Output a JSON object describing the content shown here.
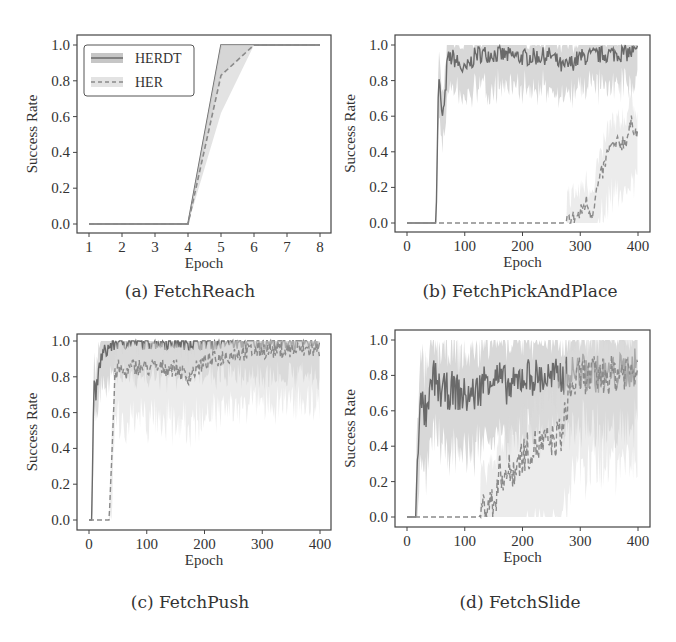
{
  "figure": {
    "legend": [
      {
        "label": "HERDT",
        "style": "solid"
      },
      {
        "label": "HER",
        "style": "dashed"
      }
    ],
    "colors": {
      "herdt_line": "#6a6a6a",
      "herdt_band": "#b8b8b8",
      "her_line": "#8a8a8a",
      "her_band": "#dcdcdc",
      "axis": "#444444"
    }
  },
  "chart_data": [
    {
      "id": "a",
      "type": "line",
      "caption": "(a) FetchReach",
      "xlabel": "Epoch",
      "ylabel": "Success Rate",
      "xticks": [
        "1",
        "2",
        "3",
        "4",
        "5",
        "6",
        "7",
        "8"
      ],
      "yticks": [
        "0.0",
        "0.2",
        "0.4",
        "0.6",
        "0.8",
        "1.0"
      ],
      "xlim": [
        1,
        8
      ],
      "ylim": [
        0,
        1
      ],
      "legend_position": "upper left",
      "series": [
        {
          "name": "HERDT",
          "x": [
            1,
            2,
            3,
            4,
            5,
            6,
            7,
            8
          ],
          "values": [
            0,
            0,
            0,
            0,
            1.0,
            1.0,
            1.0,
            1.0
          ]
        },
        {
          "name": "HER",
          "x": [
            1,
            2,
            3,
            4,
            5,
            6,
            7,
            8
          ],
          "values": [
            0,
            0,
            0,
            0,
            0.83,
            1.0,
            1.0,
            1.0
          ]
        }
      ]
    },
    {
      "id": "b",
      "type": "line",
      "caption": "(b) FetchPickAndPlace",
      "xlabel": "Epoch",
      "ylabel": "Success Rate",
      "xticks": [
        "0",
        "100",
        "200",
        "300",
        "400"
      ],
      "yticks": [
        "0.0",
        "0.2",
        "0.4",
        "0.6",
        "0.8",
        "1.0"
      ],
      "xlim": [
        0,
        400
      ],
      "ylim": [
        0,
        1
      ],
      "series": [
        {
          "name": "HERDT",
          "x": [
            0,
            50,
            55,
            60,
            65,
            70,
            80,
            100,
            120,
            150,
            200,
            250,
            270,
            300,
            350,
            400
          ],
          "values": [
            0,
            0,
            0.85,
            0.6,
            0.65,
            0.92,
            0.93,
            0.85,
            0.95,
            0.95,
            0.93,
            0.94,
            0.87,
            0.93,
            0.95,
            0.96
          ]
        },
        {
          "name": "HER",
          "x": [
            0,
            100,
            200,
            270,
            290,
            300,
            310,
            320,
            330,
            340,
            350,
            360,
            380,
            390,
            400
          ],
          "values": [
            0,
            0,
            0,
            0,
            0.03,
            0.05,
            0.12,
            0.05,
            0.2,
            0.3,
            0.42,
            0.43,
            0.47,
            0.57,
            0.48
          ]
        }
      ]
    },
    {
      "id": "c",
      "type": "line",
      "caption": "(c) FetchPush",
      "xlabel": "Epoch",
      "ylabel": "Success Rate",
      "xticks": [
        "0",
        "100",
        "200",
        "300",
        "400"
      ],
      "yticks": [
        "0.0",
        "0.2",
        "0.4",
        "0.6",
        "0.8",
        "1.0"
      ],
      "xlim": [
        0,
        400
      ],
      "ylim": [
        0,
        1
      ],
      "series": [
        {
          "name": "HERDT",
          "x": [
            0,
            5,
            8,
            12,
            20,
            30,
            40,
            50,
            60,
            80,
            100,
            200,
            300,
            400
          ],
          "values": [
            0,
            0,
            0.75,
            0.7,
            0.9,
            0.95,
            0.98,
            1.0,
            1.0,
            1.0,
            1.0,
            1.0,
            1.0,
            1.0
          ]
        },
        {
          "name": "HER",
          "x": [
            0,
            35,
            40,
            45,
            50,
            60,
            80,
            100,
            150,
            170,
            200,
            250,
            300,
            350,
            400
          ],
          "values": [
            0,
            0,
            0.4,
            0.8,
            0.85,
            0.82,
            0.86,
            0.85,
            0.85,
            0.8,
            0.88,
            0.93,
            0.95,
            0.95,
            0.95
          ]
        }
      ]
    },
    {
      "id": "d",
      "type": "line",
      "caption": "(d) FetchSlide",
      "xlabel": "Epoch",
      "ylabel": "Success Rate",
      "xticks": [
        "0",
        "100",
        "200",
        "300",
        "400"
      ],
      "yticks": [
        "0.0",
        "0.2",
        "0.4",
        "0.6",
        "0.8",
        "1.0"
      ],
      "xlim": [
        0,
        400
      ],
      "ylim": [
        0,
        1
      ],
      "series": [
        {
          "name": "HERDT",
          "x": [
            0,
            15,
            18,
            25,
            35,
            45,
            60,
            80,
            100,
            120,
            140,
            160,
            180,
            200,
            250,
            300,
            350,
            400
          ],
          "values": [
            0,
            0,
            0.4,
            0.65,
            0.55,
            0.8,
            0.7,
            0.72,
            0.68,
            0.7,
            0.8,
            0.78,
            0.72,
            0.8,
            0.78,
            0.82,
            0.8,
            0.85
          ]
        },
        {
          "name": "HER",
          "x": [
            0,
            100,
            125,
            140,
            150,
            160,
            180,
            200,
            220,
            250,
            270,
            280,
            300,
            350,
            400
          ],
          "values": [
            0,
            0,
            0,
            0.1,
            0.05,
            0.25,
            0.25,
            0.35,
            0.4,
            0.42,
            0.48,
            0.7,
            0.8,
            0.8,
            0.85
          ]
        }
      ]
    }
  ]
}
